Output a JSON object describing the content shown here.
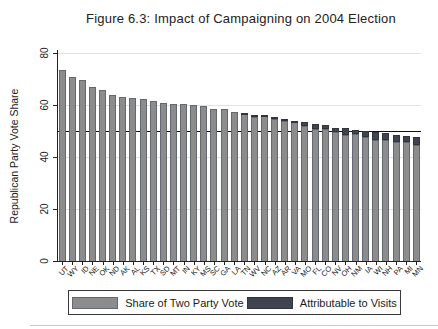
{
  "chart_data": {
    "type": "bar",
    "stacked": true,
    "title": "Figure 6.3: Impact of Campaigning on 2004 Election",
    "ylabel": "Republican Party Vote Share",
    "xlabel": "",
    "ylim": [
      0,
      80
    ],
    "yticks": [
      0,
      20,
      40,
      60,
      80
    ],
    "reference_line": 50,
    "grid": true,
    "legend_position": "bottom",
    "categories": [
      "UT",
      "WY",
      "ID",
      "NE",
      "OK",
      "ND",
      "AK",
      "AL",
      "KS",
      "TX",
      "SD",
      "MT",
      "IN",
      "KY",
      "MS",
      "SC",
      "GA",
      "LA",
      "TN",
      "WV",
      "NC",
      "AZ",
      "AR",
      "VA",
      "MO",
      "FL",
      "CO",
      "NV",
      "OH",
      "NM",
      "IA",
      "WI",
      "NH",
      "PA",
      "MI",
      "MN"
    ],
    "series": [
      {
        "name": "Share of Two Party Vote",
        "color": "#8c8c8c",
        "values": [
          73.4,
          70.8,
          69.8,
          67.0,
          65.7,
          63.8,
          63.0,
          62.7,
          62.4,
          61.5,
          60.9,
          60.4,
          60.3,
          60.1,
          59.8,
          58.4,
          58.3,
          57.5,
          56.5,
          55.3,
          55.7,
          54.7,
          53.7,
          53.5,
          52.1,
          50.6,
          50.7,
          49.6,
          48.5,
          48.7,
          47.6,
          46.6,
          46.6,
          45.6,
          45.6,
          44.8
        ]
      },
      {
        "name": "Attributable to Visits",
        "color": "#3f4450",
        "values": [
          0,
          0,
          0,
          0,
          0,
          0,
          0,
          0,
          0,
          0,
          0,
          0,
          0,
          0,
          0,
          0,
          0,
          0,
          0.5,
          1.0,
          0.5,
          0.5,
          1.0,
          0.5,
          1.5,
          2.0,
          1.5,
          1.5,
          2.5,
          1.5,
          2.5,
          3.0,
          2.5,
          3.0,
          2.5,
          3.0
        ]
      }
    ],
    "totals": [
      73.4,
      70.8,
      69.8,
      67.0,
      65.7,
      63.8,
      63.0,
      62.7,
      62.4,
      61.5,
      60.9,
      60.4,
      60.3,
      60.1,
      59.8,
      58.4,
      58.3,
      57.5,
      57.0,
      56.3,
      56.2,
      55.2,
      54.7,
      54.0,
      53.6,
      52.6,
      52.2,
      51.1,
      51.0,
      50.2,
      50.1,
      49.6,
      49.1,
      48.6,
      48.1,
      47.8
    ]
  }
}
